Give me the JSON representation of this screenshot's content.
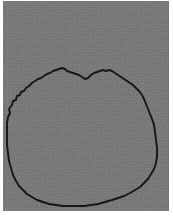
{
  "figure": {
    "frame": {
      "margin_color": "#ffffff",
      "margin_px": 3,
      "plate_width": 166,
      "plate_height": 210
    },
    "background": {
      "name": "grayscale-noise-plate",
      "base_color": "#797979",
      "texture": "fine-grain-noise"
    },
    "contour": {
      "name": "segmentation-boundary",
      "stroke_color": "#161616",
      "stroke_width": 1.9,
      "closed": true,
      "style": "jagged-polyline",
      "description": "Irregular bumpy dome on top, near-vertical sides, flat bottom edge"
    }
  },
  "chart_data": {
    "type": "line",
    "xlabel": "",
    "ylabel": "",
    "xlim": [
      0,
      166
    ],
    "ylim": [
      0,
      210
    ],
    "grid": false,
    "legend": null,
    "series": [
      {
        "name": "segmentation-boundary",
        "closed": true,
        "color": "#161616",
        "points": [
          [
            4,
            130
          ],
          [
            4,
            122
          ],
          [
            5,
            116
          ],
          [
            7,
            112
          ],
          [
            6,
            108
          ],
          [
            9,
            104
          ],
          [
            10,
            100
          ],
          [
            13,
            99
          ],
          [
            14,
            95
          ],
          [
            17,
            94
          ],
          [
            18,
            91
          ],
          [
            21,
            90
          ],
          [
            23,
            87
          ],
          [
            26,
            85
          ],
          [
            29,
            82
          ],
          [
            32,
            80
          ],
          [
            35,
            78
          ],
          [
            38,
            77
          ],
          [
            41,
            75
          ],
          [
            44,
            73
          ],
          [
            47,
            72
          ],
          [
            50,
            70
          ],
          [
            53,
            69
          ],
          [
            56,
            68
          ],
          [
            59,
            67
          ],
          [
            62,
            68
          ],
          [
            64,
            70
          ],
          [
            67,
            71
          ],
          [
            70,
            72
          ],
          [
            73,
            73
          ],
          [
            76,
            74
          ],
          [
            79,
            76
          ],
          [
            82,
            78
          ],
          [
            85,
            77
          ],
          [
            88,
            74
          ],
          [
            91,
            72
          ],
          [
            94,
            71
          ],
          [
            97,
            70
          ],
          [
            100,
            69
          ],
          [
            103,
            70
          ],
          [
            106,
            69
          ],
          [
            109,
            70
          ],
          [
            112,
            72
          ],
          [
            115,
            74
          ],
          [
            118,
            76
          ],
          [
            121,
            78
          ],
          [
            124,
            80
          ],
          [
            127,
            82
          ],
          [
            130,
            84
          ],
          [
            133,
            87
          ],
          [
            136,
            90
          ],
          [
            139,
            94
          ],
          [
            141,
            98
          ],
          [
            143,
            103
          ],
          [
            145,
            108
          ],
          [
            147,
            113
          ],
          [
            149,
            118
          ],
          [
            151,
            124
          ],
          [
            152,
            131
          ],
          [
            153,
            139
          ],
          [
            154,
            147
          ],
          [
            154,
            155
          ],
          [
            153,
            162
          ],
          [
            151,
            168
          ],
          [
            148,
            173
          ],
          [
            145,
            178
          ],
          [
            141,
            182
          ],
          [
            137,
            186
          ],
          [
            132,
            189
          ],
          [
            127,
            192
          ],
          [
            121,
            195
          ],
          [
            115,
            197
          ],
          [
            109,
            199
          ],
          [
            102,
            201
          ],
          [
            95,
            203
          ],
          [
            88,
            204
          ],
          [
            81,
            205
          ],
          [
            74,
            205
          ],
          [
            67,
            205
          ],
          [
            60,
            205
          ],
          [
            53,
            204
          ],
          [
            46,
            203
          ],
          [
            40,
            201
          ],
          [
            34,
            199
          ],
          [
            29,
            196
          ],
          [
            24,
            193
          ],
          [
            20,
            189
          ],
          [
            16,
            185
          ],
          [
            13,
            180
          ],
          [
            10,
            174
          ],
          [
            8,
            167
          ],
          [
            6,
            160
          ],
          [
            5,
            152
          ],
          [
            4,
            144
          ],
          [
            4,
            137
          ],
          [
            4,
            130
          ]
        ]
      }
    ]
  }
}
